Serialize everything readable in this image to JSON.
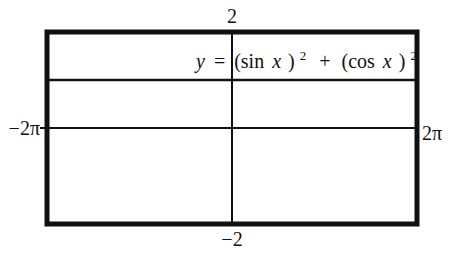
{
  "chart_data": {
    "type": "line",
    "title": "",
    "equation": {
      "lhs": "y",
      "eq": "=",
      "term1_open": "(sin",
      "term1_var": "x",
      "term1_close": ")",
      "exp1": "2",
      "plus": "+",
      "term2_open": "(cos",
      "term2_var": "x",
      "term2_close": ")",
      "exp2": "2"
    },
    "xlim": [
      -6.283185307,
      6.283185307
    ],
    "ylim": [
      -2,
      2
    ],
    "x_tick_labels": {
      "min": "−2π",
      "max": "2π"
    },
    "y_tick_labels": {
      "max": "2",
      "min": "−2"
    },
    "grid": false,
    "series": [
      {
        "name": "y = (sin x)^2 + (cos x)^2",
        "x": [
          -6.283185307,
          6.283185307
        ],
        "y": [
          1,
          1
        ]
      }
    ],
    "colors": {
      "ink": "#111111",
      "background": "#ffffff"
    }
  }
}
